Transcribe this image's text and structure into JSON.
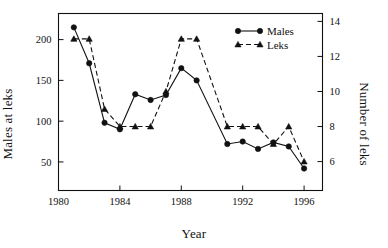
{
  "chart_data": {
    "type": "line",
    "title": "",
    "xlabel": "Year",
    "ylabel": "Males at leks",
    "ylabel_right": "Number of leks",
    "xlim": [
      1980,
      1997.2
    ],
    "ylim": [
      15,
      232
    ],
    "ylim_right": [
      4.35,
      14.45
    ],
    "xticks": [
      1980,
      1984,
      1988,
      1992,
      1996
    ],
    "yticks": [
      50,
      100,
      150,
      200
    ],
    "yticks_right": [
      6,
      8,
      10,
      12,
      14
    ],
    "grid": false,
    "legend_position": "top-right",
    "x": [
      1981,
      1982,
      1983,
      1984,
      1985,
      1986,
      1987,
      1988,
      1989,
      1991,
      1992,
      1993,
      1994,
      1995,
      1996
    ],
    "series": [
      {
        "name": "Males",
        "axis": "left",
        "marker": "circle",
        "linestyle": "solid",
        "color": "#111111",
        "values": [
          215,
          171,
          98,
          90,
          133,
          126,
          132,
          165,
          150,
          72,
          75,
          66,
          74,
          69,
          42
        ]
      },
      {
        "name": "Leks",
        "axis": "right",
        "marker": "triangle",
        "linestyle": "dashed",
        "color": "#111111",
        "values": [
          13,
          13,
          9,
          8,
          8,
          8,
          10,
          13,
          13,
          8,
          8,
          8,
          7,
          8,
          6
        ]
      }
    ],
    "xtick_labels": [
      "1980",
      "1984",
      "1988",
      "1992",
      "1996"
    ],
    "ytick_labels": [
      "50",
      "100",
      "150",
      "200"
    ],
    "ytick_right_labels": [
      "6",
      "8",
      "10",
      "12",
      "14"
    ],
    "legend": [
      {
        "label": "Males",
        "marker": "circle",
        "linestyle": "solid"
      },
      {
        "label": "Leks",
        "marker": "triangle",
        "linestyle": "dashed"
      }
    ]
  }
}
